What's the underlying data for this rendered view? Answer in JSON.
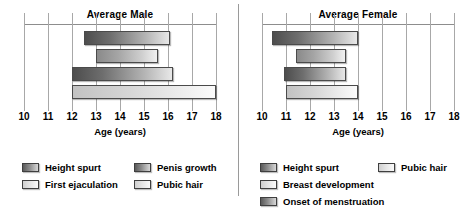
{
  "chart_data": [
    {
      "type": "bar",
      "orientation": "horizontal",
      "title": "Average Male",
      "xlabel": "Age (years)",
      "ylabel": "",
      "xlim": [
        10,
        18
      ],
      "xticks": [
        10,
        11,
        12,
        13,
        14,
        15,
        16,
        17,
        18
      ],
      "grid": true,
      "legend_position": "below",
      "bars": [
        {
          "label": "Height spurt",
          "start": 12.5,
          "end": 16.1,
          "shade": "g-dark"
        },
        {
          "label": "Penis growth",
          "start": 13.0,
          "end": 15.6,
          "shade": "g-mid"
        },
        {
          "label": "First ejaculation",
          "start": 12.0,
          "end": 16.2,
          "shade": "g-dark"
        },
        {
          "label": "Pubic hair",
          "start": 12.0,
          "end": 18.0,
          "shade": "g-light"
        }
      ],
      "legend": [
        {
          "label": "Height spurt",
          "shade": "g-dark"
        },
        {
          "label": "Penis growth",
          "shade": "g-dark"
        },
        {
          "label": "First ejaculation",
          "shade": "g-light"
        },
        {
          "label": "Pubic hair",
          "shade": "g-light"
        }
      ]
    },
    {
      "type": "bar",
      "orientation": "horizontal",
      "title": "Average Female",
      "xlabel": "Age (years)",
      "ylabel": "",
      "xlim": [
        10,
        18
      ],
      "xticks": [
        10,
        11,
        12,
        13,
        14,
        15,
        16,
        17,
        18
      ],
      "grid": true,
      "legend_position": "below",
      "bars": [
        {
          "label": "Height spurt",
          "start": 10.4,
          "end": 14.0,
          "shade": "g-dark"
        },
        {
          "label": "Breast development",
          "start": 11.4,
          "end": 13.5,
          "shade": "g-mid"
        },
        {
          "label": "Onset of menstruation",
          "start": 10.9,
          "end": 13.5,
          "shade": "g-dark"
        },
        {
          "label": "Pubic hair",
          "start": 11.0,
          "end": 14.0,
          "shade": "g-light"
        }
      ],
      "legend": [
        {
          "label": "Height spurt",
          "shade": "g-dark"
        },
        {
          "label": "Pubic hair",
          "shade": "g-light"
        },
        {
          "label": "Breast development",
          "shade": "g-light"
        },
        {
          "label": "Onset of menstruation",
          "shade": "g-dark"
        }
      ]
    }
  ]
}
